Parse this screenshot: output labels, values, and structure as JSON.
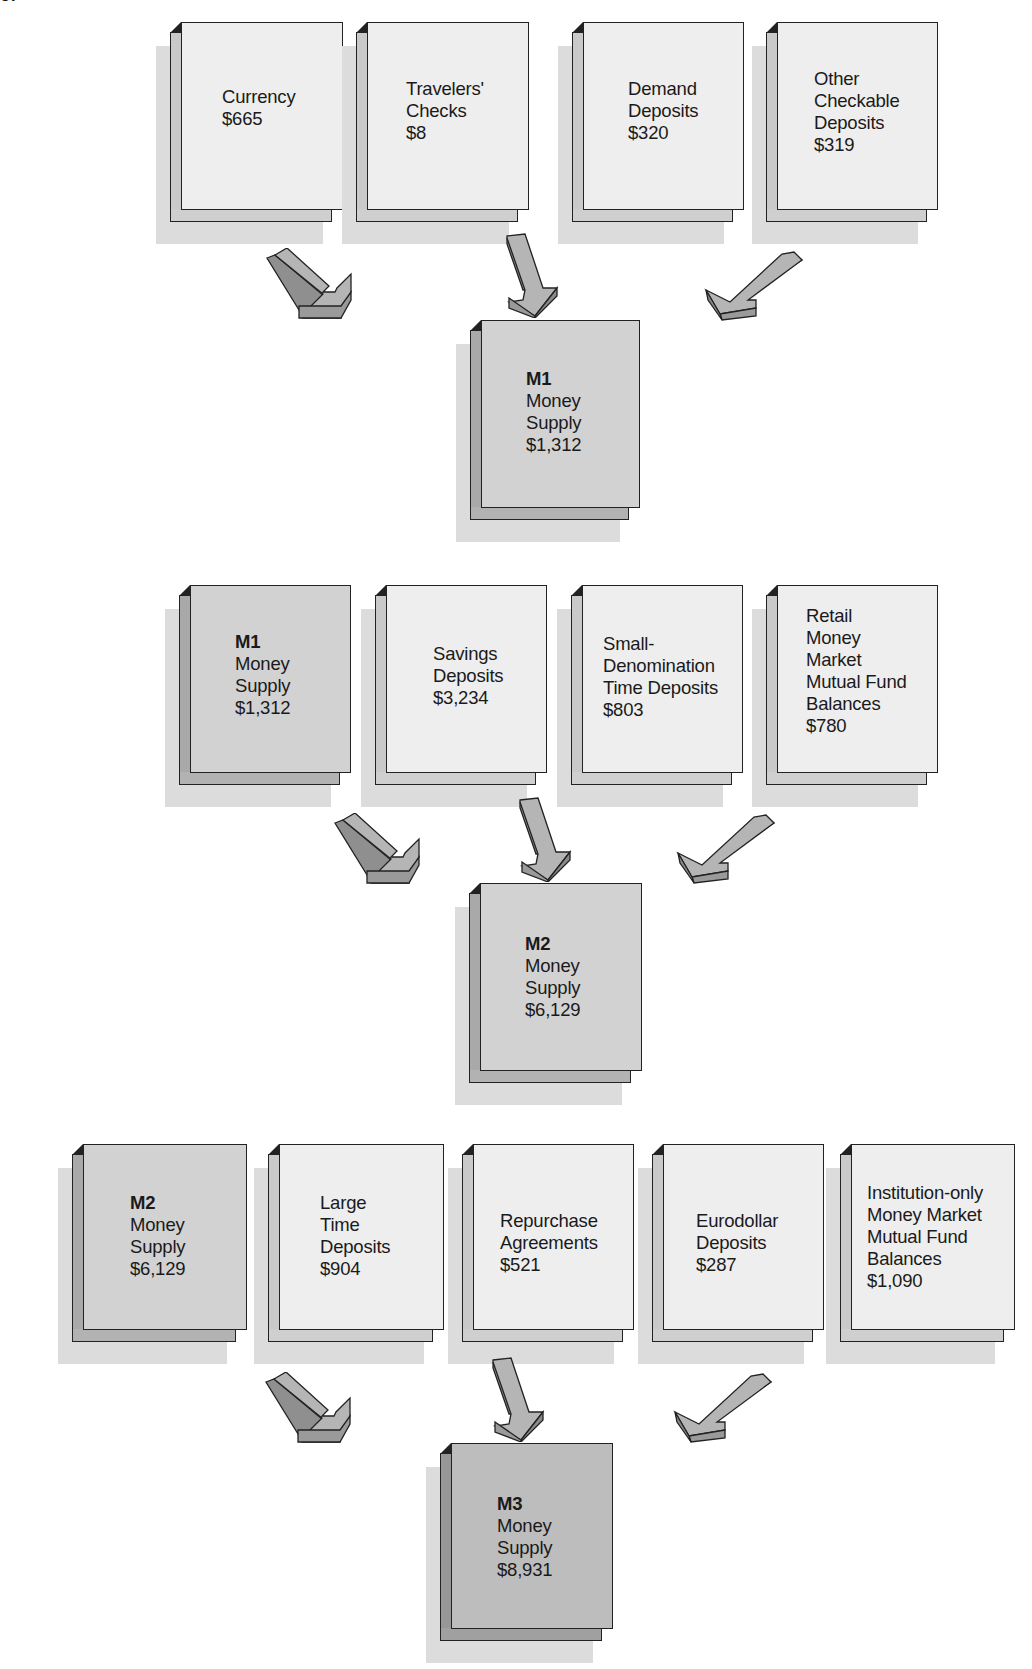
{
  "corner_text": "of",
  "colors": {
    "light_box": "#eeeeee",
    "m1_box": "#d2d2d2",
    "m2_box": "#d2d2d2",
    "m3_box": "#bdbdbd",
    "arrow": "#b0b0b0",
    "outline": "#222222"
  },
  "tier1": {
    "inputs": [
      {
        "lines": [
          "Currency",
          "$665"
        ]
      },
      {
        "lines": [
          "Travelers'",
          "Checks",
          "$8"
        ]
      },
      {
        "lines": [
          "Demand",
          "Deposits",
          "$320"
        ]
      },
      {
        "lines": [
          "Other",
          "Checkable",
          "Deposits",
          "$319"
        ]
      }
    ],
    "result": {
      "title": "M1",
      "lines": [
        "Money",
        "Supply",
        "$1,312"
      ]
    }
  },
  "tier2": {
    "inputs": [
      {
        "title": "M1",
        "lines": [
          "Money",
          "Supply",
          "$1,312"
        ]
      },
      {
        "lines": [
          "Savings",
          "Deposits",
          "$3,234"
        ]
      },
      {
        "lines": [
          "Small-",
          "Denomination",
          "Time Deposits",
          "$803"
        ]
      },
      {
        "lines": [
          "Retail",
          "Money",
          "Market",
          "Mutual Fund",
          "Balances",
          "$780"
        ]
      }
    ],
    "result": {
      "title": "M2",
      "lines": [
        "Money",
        "Supply",
        "$6,129"
      ]
    }
  },
  "tier3": {
    "inputs": [
      {
        "title": "M2",
        "lines": [
          "Money",
          "Supply",
          "$6,129"
        ]
      },
      {
        "lines": [
          "Large",
          "Time",
          "Deposits",
          "$904"
        ]
      },
      {
        "lines": [
          "Repurchase",
          "Agreements",
          "$521"
        ]
      },
      {
        "lines": [
          "Eurodollar",
          "Deposits",
          "$287"
        ]
      },
      {
        "lines": [
          "Institution-only",
          "Money Market",
          "Mutual Fund",
          "Balances",
          "$1,090"
        ]
      }
    ],
    "result": {
      "title": "M3",
      "lines": [
        "Money",
        "Supply",
        "$8,931"
      ]
    }
  }
}
